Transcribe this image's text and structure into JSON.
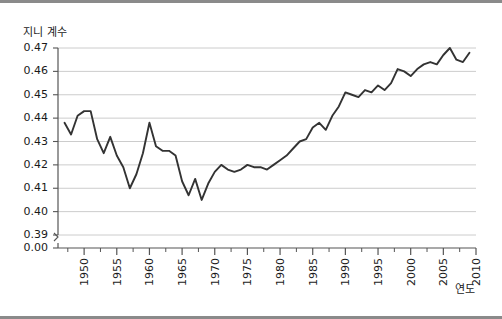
{
  "chart_data": {
    "type": "line",
    "title": "지니 계수",
    "ylabel": "지니 계수",
    "xlabel": "연도",
    "grid": true,
    "legend": false,
    "ylim": [
      0.385,
      0.475
    ],
    "xlim": [
      1946,
      2010
    ],
    "ytick_labels": [
      "0.47",
      "0.46",
      "0.45",
      "0.44",
      "0.43",
      "0.42",
      "0.41",
      "0.40",
      "0.39",
      "0.00"
    ],
    "ytick_values": [
      0.47,
      0.46,
      0.45,
      0.44,
      0.43,
      0.42,
      0.41,
      0.4,
      0.39,
      0.385
    ],
    "axis_break": true,
    "xtick_labels": [
      "1950",
      "1955",
      "1960",
      "1965",
      "1970",
      "1975",
      "1980",
      "1985",
      "1990",
      "1995",
      "2000",
      "2005",
      "2010"
    ],
    "xtick_values": [
      1950,
      1955,
      1960,
      1965,
      1970,
      1975,
      1980,
      1985,
      1990,
      1995,
      2000,
      2005,
      2010
    ],
    "minor_xticks": [
      1947.5,
      1952.5,
      1957.5,
      1962.5,
      1967.5,
      1972.5,
      1977.5,
      1982.5,
      1987.5,
      1992.5,
      1997.5,
      2002.5,
      2007.5
    ],
    "line_color": "#333333",
    "grid_color": "#cccccc",
    "axis_color": "#555555",
    "x": [
      1947,
      1948,
      1949,
      1950,
      1951,
      1952,
      1953,
      1954,
      1955,
      1956,
      1957,
      1958,
      1959,
      1960,
      1961,
      1962,
      1963,
      1964,
      1965,
      1966,
      1967,
      1968,
      1969,
      1970,
      1971,
      1972,
      1973,
      1974,
      1975,
      1976,
      1977,
      1978,
      1979,
      1980,
      1981,
      1982,
      1983,
      1984,
      1985,
      1986,
      1987,
      1988,
      1989,
      1990,
      1991,
      1992,
      1993,
      1994,
      1995,
      1996,
      1997,
      1998,
      1999,
      2000,
      2001,
      2002,
      2003,
      2004,
      2005,
      2006,
      2007,
      2008,
      2009
    ],
    "values": [
      0.438,
      0.433,
      0.441,
      0.443,
      0.443,
      0.431,
      0.425,
      0.432,
      0.424,
      0.419,
      0.41,
      0.416,
      0.425,
      0.438,
      0.428,
      0.426,
      0.426,
      0.424,
      0.413,
      0.407,
      0.414,
      0.405,
      0.412,
      0.417,
      0.42,
      0.418,
      0.417,
      0.418,
      0.42,
      0.419,
      0.419,
      0.418,
      0.42,
      0.422,
      0.424,
      0.427,
      0.43,
      0.431,
      0.436,
      0.438,
      0.435,
      0.441,
      0.445,
      0.451,
      0.45,
      0.449,
      0.452,
      0.451,
      0.454,
      0.452,
      0.455,
      0.461,
      0.46,
      0.458,
      0.461,
      0.463,
      0.464,
      0.463,
      0.467,
      0.47,
      0.465,
      0.464,
      0.468
    ]
  }
}
